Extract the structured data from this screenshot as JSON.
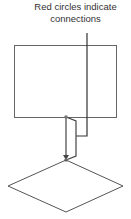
{
  "annotation": {
    "line1": "Red circles indicate",
    "line2": "connections"
  },
  "colors": {
    "stroke": "#555555",
    "text": "#333333",
    "background": "#ffffff"
  }
}
